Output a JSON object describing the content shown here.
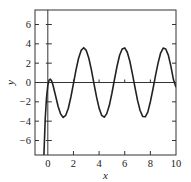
{
  "chart_data": {
    "type": "line",
    "title": "",
    "xlabel": "x",
    "ylabel": "y",
    "xlim": [
      -1,
      10
    ],
    "ylim": [
      -7.5,
      7.5
    ],
    "grid": false,
    "legend": null,
    "x_ticks": [
      0,
      2,
      4,
      6,
      8,
      10
    ],
    "x_tick_labels": [
      "0",
      "2",
      "4",
      "6",
      "8",
      "10"
    ],
    "y_ticks": [
      -6,
      -4,
      -2,
      0,
      2,
      4,
      6
    ],
    "y_tick_labels": [
      "−6",
      "−4",
      "−2",
      "0",
      "2",
      "4",
      "6"
    ],
    "reference_lines": {
      "horizontal_y": 0,
      "vertical_x": 0
    },
    "series": [
      {
        "name": "y(x)",
        "color": "#222222",
        "x": [
          -0.35,
          -0.3,
          -0.2,
          -0.1,
          0,
          0.1,
          0.2,
          0.3,
          0.4,
          0.6,
          0.8,
          1.0,
          1.2,
          1.4,
          1.6,
          1.8,
          2.0,
          2.2,
          2.4,
          2.6,
          2.8,
          3.0,
          3.2,
          3.4,
          3.6,
          3.8,
          4.0,
          4.2,
          4.4,
          4.6,
          4.8,
          5.0,
          5.2,
          5.4,
          5.6,
          5.8,
          6.0,
          6.2,
          6.4,
          6.6,
          6.8,
          7.0,
          7.2,
          7.4,
          7.6,
          7.8,
          8.0,
          8.2,
          8.4,
          8.6,
          8.8,
          9.0,
          9.2,
          9.4,
          9.6,
          9.8,
          10.0
        ],
        "y": [
          -9.9,
          -7.34,
          -3.72,
          -1.53,
          -0.3,
          0.25,
          0.35,
          0.15,
          -0.26,
          -1.35,
          -2.46,
          -3.27,
          -3.61,
          -3.39,
          -2.66,
          -1.5,
          -0.11,
          1.3,
          2.51,
          3.32,
          3.6,
          3.32,
          2.51,
          1.3,
          -0.11,
          -1.49,
          -2.65,
          -3.39,
          -3.59,
          -3.22,
          -2.36,
          -1.11,
          0.31,
          1.68,
          2.82,
          3.47,
          3.58,
          3.13,
          2.2,
          0.89,
          -0.51,
          -1.85,
          -2.9,
          -3.51,
          -3.55,
          -3.06,
          -1.99,
          -0.7,
          0.72,
          2.0,
          3.05,
          3.56,
          3.47,
          2.83,
          1.7,
          0.3,
          -0.5
        ]
      }
    ],
    "annotations": []
  },
  "layout": {
    "frame_px": {
      "left": 35,
      "top": 10,
      "right": 176,
      "bottom": 155
    }
  }
}
